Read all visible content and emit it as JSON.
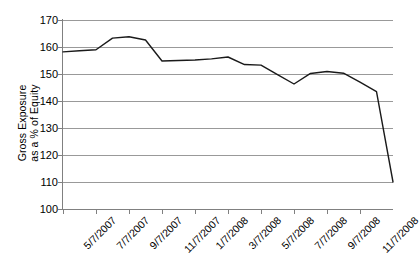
{
  "chart_data": {
    "type": "line",
    "title": "",
    "xlabel": "",
    "ylabel": "Gross Exposure as a % of Equity",
    "ylabel_line1": "Gross Exposure",
    "ylabel_line2": "as a % of Equity",
    "ylim": [
      100,
      170
    ],
    "ytick_step": 10,
    "yticks": [
      170,
      160,
      150,
      140,
      130,
      120,
      110,
      100
    ],
    "ytick_labels": [
      "170",
      "160",
      "150",
      "140",
      "130",
      "120",
      "110",
      "100"
    ],
    "xticks": [
      "5/7/2007",
      "7/7/2007",
      "9/7/2007",
      "11/7/2007",
      "1/7/2008",
      "3/7/2008",
      "5/7/2008",
      "7/7/2008",
      "9/7/2008",
      "11/7/2008"
    ],
    "grid": true,
    "legend": "none",
    "series": [
      {
        "name": "Gross Exposure",
        "line_color": "#1a1a1a",
        "line_width": 1.4,
        "x": [
          "5/7/2007",
          "6/7/2007",
          "7/7/2007",
          "8/7/2007",
          "9/7/2007",
          "10/7/2007",
          "11/7/2007",
          "12/7/2007",
          "1/7/2008",
          "2/7/2008",
          "3/7/2008",
          "4/7/2008",
          "5/7/2008",
          "6/7/2008",
          "7/7/2008",
          "8/7/2008",
          "9/7/2008",
          "10/7/2008",
          "11/7/2008",
          "12/7/2008",
          "1/7/2009"
        ],
        "values": [
          158.2,
          158.6,
          159.0,
          163.3,
          163.8,
          162.6,
          154.8,
          155.0,
          155.2,
          155.6,
          156.3,
          153.5,
          153.3,
          149.8,
          146.3,
          150.2,
          150.9,
          150.3,
          147.0,
          143.5,
          110.0
        ]
      }
    ]
  },
  "axes": {
    "y_title_line1": "Gross Exposure",
    "y_title_line2": "as a % of Equity"
  }
}
